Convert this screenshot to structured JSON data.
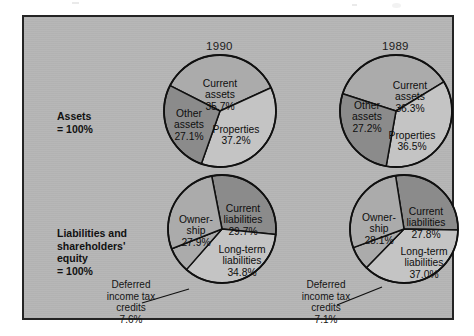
{
  "figure": {
    "background_color": "#b6b6b6",
    "border_color": "#242424",
    "page_color": "#ffffff"
  },
  "columns": [
    {
      "id": "col-1990",
      "year": "1990"
    },
    {
      "id": "col-1989",
      "year": "1989"
    }
  ],
  "rows": [
    {
      "id": "row-assets",
      "label": "Assets\n= 100%"
    },
    {
      "id": "row-liabilities",
      "label": "Liabilities and\nshareholders'\nequity\n= 100%"
    }
  ],
  "callouts": {
    "deferred_1990": "Deferred\nincome tax\ncredits\n7.6%",
    "deferred_1989": "Deferred\nincome tax\ncredits\n7.1%"
  },
  "palette": {
    "slice_light": "#c4c4c4",
    "slice_medium": "#ababab",
    "slice_dark": "#8b8b8b",
    "outline": "#101010"
  },
  "chart_data": [
    {
      "type": "pie",
      "id": "assets-1990",
      "title": "1990",
      "group": "Assets = 100%",
      "total_label": "= 100%",
      "categories": [
        "Current assets",
        "Properties",
        "Other assets"
      ],
      "values": [
        35.7,
        37.2,
        27.1
      ],
      "labels": [
        "Current\nassets\n35.7%",
        "Properties\n37.2%",
        "Other\nassets\n27.1%"
      ],
      "colors": [
        "#ababab",
        "#c4c4c4",
        "#8b8b8b"
      ],
      "start_angle_deg": 0,
      "legend": "none",
      "grid": false
    },
    {
      "type": "pie",
      "id": "assets-1989",
      "title": "1989",
      "group": "Assets = 100%",
      "total_label": "= 100%",
      "categories": [
        "Current assets",
        "Properties",
        "Other assets"
      ],
      "values": [
        36.3,
        36.5,
        27.2
      ],
      "labels": [
        "Current\nassets\n36.3%",
        "Properties\n36.5%",
        "Other\nassets\n27.2%"
      ],
      "colors": [
        "#ababab",
        "#c4c4c4",
        "#8b8b8b"
      ],
      "start_angle_deg": 0,
      "legend": "none",
      "grid": false
    },
    {
      "type": "pie",
      "id": "liabilities-1990",
      "title": "1990",
      "group": "Liabilities and shareholders' equity = 100%",
      "total_label": "= 100%",
      "categories": [
        "Current liabilities",
        "Long-term liabilities",
        "Deferred income tax credits",
        "Ownership"
      ],
      "values": [
        29.7,
        34.8,
        7.6,
        27.9
      ],
      "labels": [
        "Current\nliabilities\n29.7%",
        "Long-term\nliabilities\n34.8%",
        "Deferred\nincome tax\ncredits\n7.6%",
        "Owner-\nship\n27.9%"
      ],
      "colors": [
        "#8b8b8b",
        "#c4c4c4",
        "#ababab",
        "#ababab"
      ],
      "start_angle_deg": 0,
      "legend": "none",
      "grid": false
    },
    {
      "type": "pie",
      "id": "liabilities-1989",
      "title": "1989",
      "group": "Liabilities and shareholders' equity = 100%",
      "total_label": "= 100%",
      "categories": [
        "Current liabilities",
        "Long-term liabilities",
        "Deferred income tax credits",
        "Ownership"
      ],
      "values": [
        27.8,
        37.0,
        7.1,
        28.1
      ],
      "labels": [
        "Current\nliabilities\n27.8%",
        "Long-term\nliabilities\n37.0%",
        "Deferred\nincome tax\ncredits\n7.1%",
        "Owner-\nship\n28.1%"
      ],
      "colors": [
        "#8b8b8b",
        "#c4c4c4",
        "#ababab",
        "#ababab"
      ],
      "start_angle_deg": 0,
      "legend": "none",
      "grid": false
    }
  ],
  "slice_text": {
    "a90_current": "Current",
    "a90_current2": "assets",
    "a90_current3": "35.7%",
    "a90_props": "Properties",
    "a90_props2": "37.2%",
    "a90_other": "Other",
    "a90_other2": "assets",
    "a90_other3": "27.1%",
    "a89_current": "Current",
    "a89_current2": "assets",
    "a89_current3": "36.3%",
    "a89_props": "Properties",
    "a89_props2": "36.5%",
    "a89_other": "Other",
    "a89_other2": "assets",
    "a89_other3": "27.2%",
    "l90_cur": "Current",
    "l90_cur2": "liabilities",
    "l90_cur3": "29.7%",
    "l90_lt": "Long-term",
    "l90_lt2": "liabilities",
    "l90_lt3": "34.8%",
    "l90_own": "Owner-",
    "l90_own2": "ship",
    "l90_own3": "27.9%",
    "l89_cur": "Current",
    "l89_cur2": "liabilities",
    "l89_cur3": "27.8%",
    "l89_lt": "Long-term",
    "l89_lt2": "liabilities",
    "l89_lt3": "37.0%",
    "l89_own": "Owner-",
    "l89_own2": "ship",
    "l89_own3": "28.1%"
  }
}
